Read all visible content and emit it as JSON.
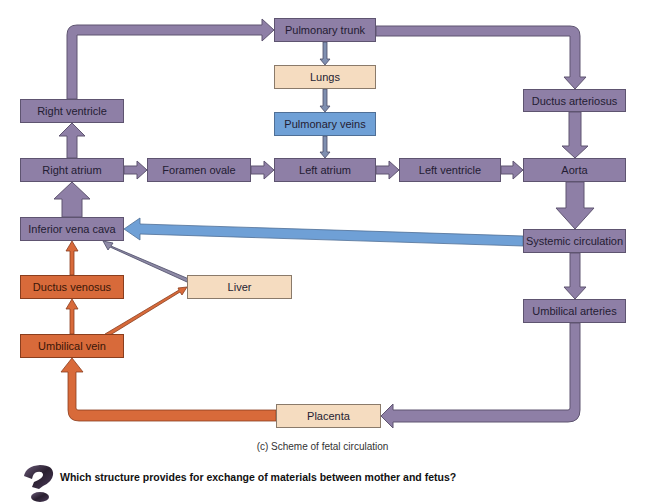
{
  "diagram": {
    "nodes": {
      "pulmonary_trunk": "Pulmonary trunk",
      "lungs": "Lungs",
      "pulmonary_veins": "Pulmonary veins",
      "right_ventricle": "Right ventricle",
      "ductus_arteriosus": "Ductus arteriosus",
      "right_atrium": "Right atrium",
      "foramen_ovale": "Foramen ovale",
      "left_atrium": "Left atrium",
      "left_ventricle": "Left ventricle",
      "aorta": "Aorta",
      "inferior_vena_cava": "Inferior vena cava",
      "systemic_circulation": "Systemic circulation",
      "ductus_venosus": "Ductus venosus",
      "liver": "Liver",
      "umbilical_arteries": "Umbilical arteries",
      "umbilical_vein": "Umbilical vein",
      "placenta": "Placenta"
    },
    "edges": [
      {
        "from": "Right ventricle",
        "to": "Pulmonary trunk"
      },
      {
        "from": "Pulmonary trunk",
        "to": "Lungs"
      },
      {
        "from": "Lungs",
        "to": "Pulmonary veins"
      },
      {
        "from": "Pulmonary veins",
        "to": "Left atrium"
      },
      {
        "from": "Pulmonary trunk",
        "to": "Ductus arteriosus"
      },
      {
        "from": "Ductus arteriosus",
        "to": "Aorta"
      },
      {
        "from": "Right atrium",
        "to": "Right ventricle"
      },
      {
        "from": "Right atrium",
        "to": "Foramen ovale"
      },
      {
        "from": "Foramen ovale",
        "to": "Left atrium"
      },
      {
        "from": "Left atrium",
        "to": "Left ventricle"
      },
      {
        "from": "Left ventricle",
        "to": "Aorta"
      },
      {
        "from": "Aorta",
        "to": "Systemic circulation"
      },
      {
        "from": "Systemic circulation",
        "to": "Inferior vena cava"
      },
      {
        "from": "Systemic circulation",
        "to": "Umbilical arteries"
      },
      {
        "from": "Umbilical arteries",
        "to": "Placenta"
      },
      {
        "from": "Placenta",
        "to": "Umbilical vein"
      },
      {
        "from": "Umbilical vein",
        "to": "Ductus venosus"
      },
      {
        "from": "Umbilical vein",
        "to": "Liver"
      },
      {
        "from": "Ductus venosus",
        "to": "Inferior vena cava"
      },
      {
        "from": "Liver",
        "to": "Inferior vena cava"
      },
      {
        "from": "Inferior vena cava",
        "to": "Right atrium"
      }
    ],
    "colors": {
      "deoxygenated_mixed": "#8e7fa6",
      "oxygenated": "#d86a3a",
      "lungs_liver_placenta": "#f5dcc0",
      "pulmonary_veins": "#6fa0d6"
    }
  },
  "caption": "(c) Scheme of fetal circulation",
  "question": {
    "icon": "question-mark-icon",
    "text": "Which structure provides for exchange of materials between mother and fetus?"
  }
}
